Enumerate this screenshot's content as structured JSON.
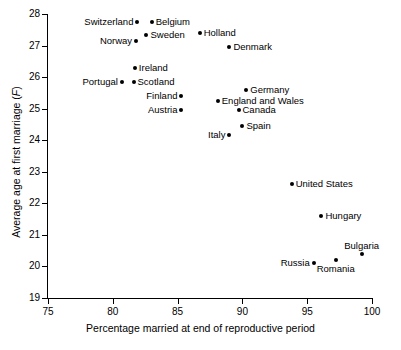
{
  "chart_data": {
    "type": "scatter",
    "title": "",
    "xlabel": "Percentage married at end of reproductive period",
    "ylabel": "Average age at first marriage (F)",
    "ylabel_prefix": "Average age at first marriage (",
    "ylabel_italic": "F",
    "ylabel_suffix": ")",
    "xlim": [
      75,
      100
    ],
    "ylim": [
      19,
      28
    ],
    "xticks": [
      75,
      80,
      85,
      90,
      95,
      100
    ],
    "yticks": [
      19,
      20,
      21,
      22,
      23,
      24,
      25,
      26,
      27,
      28
    ],
    "grid": false,
    "legend": "none",
    "marker": "filled-circle",
    "marker_color": "#000000",
    "points": [
      {
        "label": "Switzerland",
        "x": 81.9,
        "y": 27.75,
        "label_pos": "left"
      },
      {
        "label": "Belgium",
        "x": 83.0,
        "y": 27.75,
        "label_pos": "right"
      },
      {
        "label": "Sweden",
        "x": 82.6,
        "y": 27.35,
        "label_pos": "right"
      },
      {
        "label": "Norway",
        "x": 81.8,
        "y": 27.15,
        "label_pos": "left"
      },
      {
        "label": "Holland",
        "x": 86.7,
        "y": 27.4,
        "label_pos": "right"
      },
      {
        "label": "Denmark",
        "x": 89.0,
        "y": 26.95,
        "label_pos": "right"
      },
      {
        "label": "Ireland",
        "x": 81.7,
        "y": 26.3,
        "label_pos": "right"
      },
      {
        "label": "Portugal",
        "x": 80.7,
        "y": 25.85,
        "label_pos": "left"
      },
      {
        "label": "Scotland",
        "x": 81.6,
        "y": 25.85,
        "label_pos": "right"
      },
      {
        "label": "Finland",
        "x": 85.3,
        "y": 25.4,
        "label_pos": "left"
      },
      {
        "label": "England and Wales",
        "x": 88.1,
        "y": 25.25,
        "label_pos": "right"
      },
      {
        "label": "Austria",
        "x": 85.3,
        "y": 24.95,
        "label_pos": "left"
      },
      {
        "label": "Canada",
        "x": 89.7,
        "y": 24.95,
        "label_pos": "right"
      },
      {
        "label": "Germany",
        "x": 90.3,
        "y": 25.6,
        "label_pos": "right"
      },
      {
        "label": "Spain",
        "x": 90.0,
        "y": 24.45,
        "label_pos": "right"
      },
      {
        "label": "Italy",
        "x": 89.0,
        "y": 24.15,
        "label_pos": "left"
      },
      {
        "label": "United States",
        "x": 93.8,
        "y": 22.6,
        "label_pos": "right"
      },
      {
        "label": "Hungary",
        "x": 96.1,
        "y": 21.6,
        "label_pos": "right"
      },
      {
        "label": "Russia",
        "x": 95.5,
        "y": 20.1,
        "label_pos": "left"
      },
      {
        "label": "Romania",
        "x": 97.2,
        "y": 20.2,
        "label_pos": "below"
      },
      {
        "label": "Bulgaria",
        "x": 99.2,
        "y": 20.4,
        "label_pos": "above"
      }
    ]
  }
}
